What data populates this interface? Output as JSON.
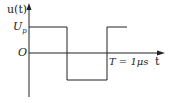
{
  "diagram": {
    "type": "square-wave-plot",
    "y_axis_label": "u(t)",
    "x_axis_label": "t",
    "level_high_label": "U",
    "level_high_subscript": "p",
    "origin_label": "O",
    "period_label": "T = 1μs",
    "colors": {
      "line": "#222222",
      "background": "#ffffff"
    },
    "waveform": {
      "segments": [
        {
          "from_t": 0,
          "to_t": 0.5,
          "level": "high"
        },
        {
          "from_t": 0.5,
          "to_t": 1.0,
          "level": "low"
        },
        {
          "from_t": 1.0,
          "to_t": 1.2,
          "level": "high"
        }
      ]
    }
  }
}
